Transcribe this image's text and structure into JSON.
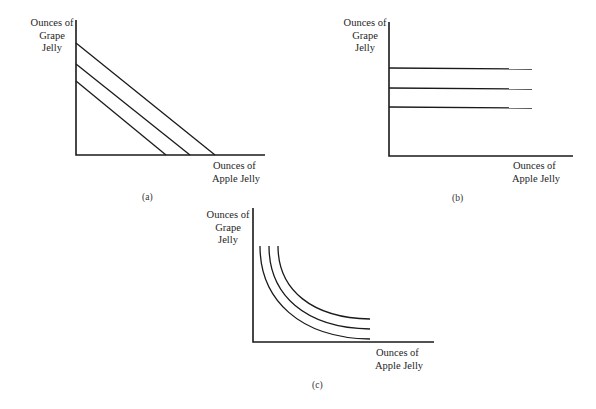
{
  "panels": [
    {
      "id": "a",
      "caption": "(a)",
      "y_label": [
        "Ounces of",
        "Grape",
        "Jelly"
      ],
      "x_label": [
        "Ounces of",
        "Apple Jelly"
      ],
      "curve_type": "straight-line indifference curves (perfect substitutes)"
    },
    {
      "id": "b",
      "caption": "(b)",
      "y_label": [
        "Ounces of",
        "Grape",
        "Jelly"
      ],
      "x_label": [
        "Ounces of",
        "Apple Jelly"
      ],
      "curve_type": "horizontal indifference curves"
    },
    {
      "id": "c",
      "caption": "(c)",
      "y_label": [
        "Ounces of",
        "Grape",
        "Jelly"
      ],
      "x_label": [
        "Ounces of",
        "Apple Jelly"
      ],
      "curve_type": "convex indifference curves"
    }
  ],
  "geometry": {
    "a": {
      "axis": {
        "x0": 76,
        "ytop": 20,
        "y0": 155,
        "xend": 265
      },
      "lines": [
        {
          "x1": 76,
          "y1": 81,
          "x2": 166,
          "y2": 155
        },
        {
          "x1": 76,
          "y1": 64,
          "x2": 190,
          "y2": 155
        },
        {
          "x1": 76,
          "y1": 43,
          "x2": 215,
          "y2": 155
        }
      ]
    },
    "b": {
      "axis": {
        "x0": 389,
        "ytop": 22,
        "y0": 156,
        "xend": 573
      },
      "lines": [
        {
          "x1": 389,
          "y1": 68,
          "x2": 532,
          "y2": 69
        },
        {
          "x1": 389,
          "y1": 88,
          "x2": 532,
          "y2": 89
        },
        {
          "x1": 389,
          "y1": 107,
          "x2": 532,
          "y2": 108
        }
      ]
    },
    "c": {
      "axis": {
        "x0": 253,
        "ytop": 208,
        "y0": 342,
        "xend": 434
      },
      "curves": [
        "M260,246 C260,300 300,338 370,339",
        "M269,246 C269,295 305,328 370,329",
        "M278,246 C278,290 312,318 370,319"
      ]
    }
  },
  "colors": {
    "stroke": "#1a1a1a",
    "background": "#ffffff"
  }
}
